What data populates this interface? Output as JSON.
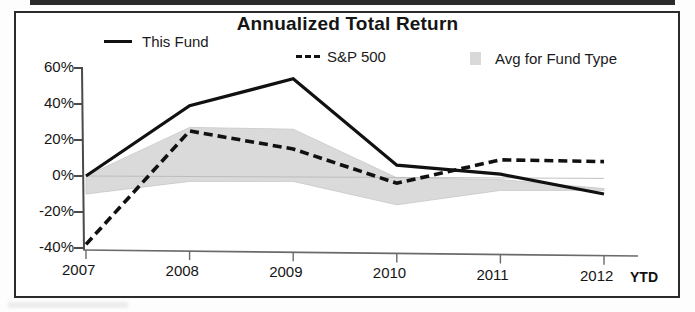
{
  "chart_data": {
    "type": "line",
    "title": "Annualized Total Return",
    "xlabel": "",
    "ylabel": "",
    "categories": [
      "2007",
      "2008",
      "2009",
      "2010",
      "2011",
      "2012"
    ],
    "x_extra_label": "YTD",
    "ylim": [
      -40,
      60
    ],
    "yticks": [
      60,
      40,
      20,
      0,
      -20,
      -40
    ],
    "ytick_labels": [
      "60%",
      "40%",
      "20%",
      "0%",
      "-20%",
      "-40%"
    ],
    "grid": false,
    "legend_position": "top",
    "series": [
      {
        "name": "This Fund",
        "style": "solid",
        "color": "#111111",
        "values": [
          0,
          39,
          54,
          6,
          1,
          -10
        ]
      },
      {
        "name": "S&P 500",
        "style": "dashed",
        "color": "#111111",
        "values": [
          -38,
          25,
          15,
          -4,
          9,
          8
        ]
      },
      {
        "name": "Avg for Fund Type",
        "style": "band",
        "color": "#d9d9d9",
        "band_upper": [
          0,
          27,
          26,
          -1,
          -2,
          -7
        ],
        "band_lower": [
          -10,
          -3,
          -3,
          -16,
          -8,
          -8
        ]
      }
    ]
  },
  "chart": {
    "title": "Annualized Total Return",
    "legend": [
      {
        "label": "This Fund",
        "marker": "solid-line",
        "color": "#111111"
      },
      {
        "label": "S&P 500",
        "marker": "dashed-line",
        "color": "#111111"
      },
      {
        "label": "Avg for Fund Type",
        "marker": "gray-swatch",
        "color": "#d9d9d9"
      }
    ],
    "y_axis": {
      "labels": [
        "60%",
        "40%",
        "20%",
        "0%",
        "-20%",
        "-40%"
      ]
    },
    "x_axis": {
      "labels": [
        "2007",
        "2008",
        "2009",
        "2010",
        "2011",
        "2012"
      ],
      "suffix": "YTD"
    }
  }
}
